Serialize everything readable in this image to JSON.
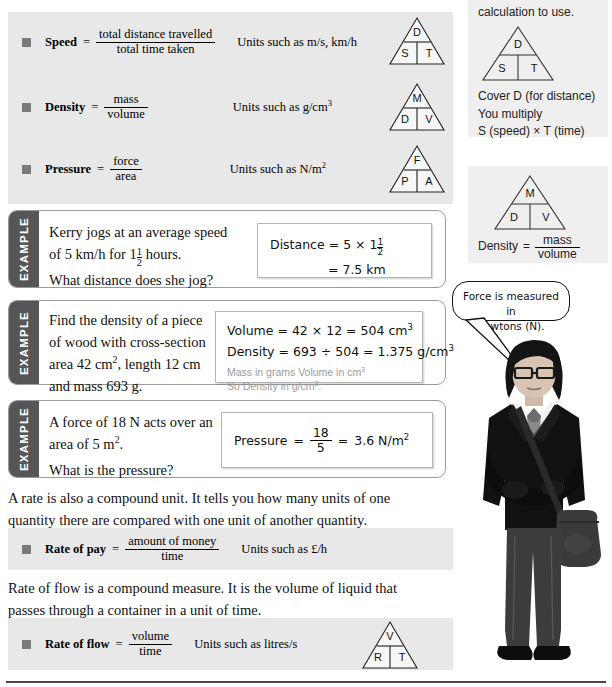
{
  "page": {
    "cut_top_line": "",
    "bottom_rule": true
  },
  "formula_panel": {
    "rows": [
      {
        "name": "Speed",
        "numerator": "total distance travelled",
        "denominator": "total time taken",
        "units": "Units such as m/s, km/h",
        "triangle": {
          "top": "D",
          "left": "S",
          "right": "T"
        }
      },
      {
        "name": "Density",
        "numerator": "mass",
        "denominator": "volume",
        "units": "Units such as g/cm",
        "units_sup": "3",
        "triangle": {
          "top": "M",
          "left": "D",
          "right": "V"
        }
      },
      {
        "name": "Pressure",
        "numerator": "force",
        "denominator": "area",
        "units": "Units such as N/m",
        "units_sup": "2",
        "triangle": {
          "top": "F",
          "left": "P",
          "right": "A"
        }
      }
    ]
  },
  "examples": [
    {
      "tab_label": "EXAMPLE",
      "question_line1": "Kerry jogs at an average speed",
      "question_line2_pre": "of 5 km/h for 1",
      "question_frac_num": "1",
      "question_frac_den": "2",
      "question_line2_post": " hours.",
      "question_line3": "What distance does she jog?",
      "answer": {
        "line1_label": "Distance",
        "line1_eq": "=",
        "line1_value": "5 × 1",
        "line1_frac_num": "1",
        "line1_frac_den": "2",
        "line2": "= 7.5 km"
      }
    },
    {
      "tab_label": "EXAMPLE",
      "question_line1": "Find the density of a piece",
      "question_line2": "of wood with cross-section",
      "question_line3_pre": "area 42 cm",
      "question_line3_sup": "2",
      "question_line3_post": ", length 12 cm",
      "question_line4": "and mass 693 g.",
      "answer": {
        "line1": "Volume = 42 × 12 = 504 cm",
        "line1_sup": "3",
        "line2": "Density = 693 ÷ 504 = 1.375 g/cm",
        "line2_sup": "3",
        "note1_pre": "Mass in grams Volume in cm",
        "note1_sup": "3",
        "note2_pre": "So Density in g/cm",
        "note2_sup": "3",
        "note2_post": "."
      }
    },
    {
      "tab_label": "EXAMPLE",
      "question_line1_pre": "A force of 18 N acts over an",
      "question_line2_pre": "area of 5 m",
      "question_line2_sup": "2",
      "question_line2_post": ".",
      "question_line3": "What is the pressure?",
      "answer": {
        "label": "Pressure",
        "eq1": "=",
        "frac_num": "18",
        "frac_den": "5",
        "eq2": "=",
        "result": "3.6 N/m",
        "result_sup": "2"
      }
    }
  ],
  "paragraphs": {
    "rate_intro_line1": "A rate is also a compound unit. It tells you how many units of one",
    "rate_intro_line2": "quantity there are compared with one unit of another quantity.",
    "flow_intro_line1": "Rate of flow is a compound measure. It is the volume of liquid that",
    "flow_intro_line2": "passes through a container in a unit of time."
  },
  "rate_of_pay": {
    "name": "Rate of pay",
    "numerator": "amount of money",
    "denominator": "time",
    "units": "Units such as £/h"
  },
  "rate_of_flow": {
    "name": "Rate of flow",
    "numerator": "volume",
    "denominator": "time",
    "units": "Units such as litres/s",
    "triangle": {
      "top": "V",
      "left": "R",
      "right": "T"
    }
  },
  "sidebar": {
    "box1": {
      "text": "calculation to use.",
      "triangle": {
        "top": "D",
        "left": "S",
        "right": "T"
      },
      "note_line1": "Cover D (for distance)",
      "note_line2": "You multiply",
      "note_line3": "S (speed) × T (time)"
    },
    "box2": {
      "triangle": {
        "top": "M",
        "left": "D",
        "right": "V"
      },
      "label": "Density",
      "eq": "=",
      "numerator": "mass",
      "denominator": "volume"
    }
  },
  "speech_bubble": {
    "line1": "Force is measured in",
    "line2": "newtons (N)."
  },
  "colors": {
    "panel_bg": "#e8e8e8",
    "sidebar_bg": "#efefef",
    "tab_bg": "#565656",
    "bullet": "#7a7a7a",
    "note_grey": "#9b9b9b"
  }
}
